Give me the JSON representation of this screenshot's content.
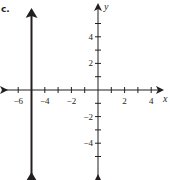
{
  "figure": {
    "part_label": "c.",
    "colors": {
      "ink": "#231f20",
      "background": "#ffffff"
    }
  },
  "chart_data": {
    "type": "line",
    "title": "c.",
    "xlabel": "x",
    "ylabel": "y",
    "xlim": [
      -7,
      5
    ],
    "ylim": [
      -6,
      6
    ],
    "grid": false,
    "legend": null,
    "x_ticks": [
      -6,
      -5,
      -4,
      -3,
      -2,
      -1,
      1,
      2,
      3,
      4
    ],
    "x_tick_labels": [
      "-6",
      "-4",
      "-2",
      "2",
      "4"
    ],
    "y_ticks": [
      -5,
      -4,
      -3,
      -2,
      -1,
      1,
      2,
      3,
      4,
      5
    ],
    "y_tick_labels": [
      "-4",
      "-2",
      "2",
      "4"
    ],
    "series": [
      {
        "name": "vertical line x = -5",
        "equation": "x = -5",
        "points": [
          [
            -5,
            -6
          ],
          [
            -5,
            6
          ]
        ],
        "arrows_both_ends": true
      }
    ]
  }
}
